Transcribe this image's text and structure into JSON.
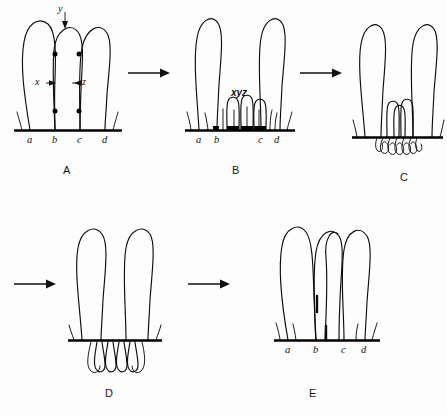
{
  "figure": {
    "background_color": "#fdfdfd",
    "ink_color": "#0d0d0d",
    "width": 447,
    "height": 415
  },
  "panels": [
    {
      "id": "A",
      "letter": "A",
      "letter_x": 63,
      "letter_y": 165,
      "origin_x": 8,
      "origin_y": 4,
      "baseline_label": [
        "a",
        "b",
        "c",
        "d"
      ],
      "tick_positions": [
        22,
        47,
        72,
        97
      ],
      "markers": [
        {
          "name": "y",
          "text": "y",
          "x": 45,
          "y": 2,
          "style": "marker-label"
        },
        {
          "name": "x",
          "text": "x",
          "x": 28,
          "y": 74,
          "style": "marker-label"
        },
        {
          "name": "z",
          "text": "z",
          "x": 62,
          "y": 74,
          "style": "marker-label"
        }
      ],
      "node_count": 4,
      "loop_count": 3
    },
    {
      "id": "B",
      "letter": "B",
      "letter_x": 232,
      "letter_y": 165,
      "origin_x": 183,
      "origin_y": 4,
      "baseline_label": [
        "a",
        "b",
        "c",
        "d"
      ],
      "tick_positions": [
        16,
        34,
        78,
        94
      ],
      "markers": [
        {
          "name": "xyz",
          "text": "xyz",
          "x": 39,
          "y": 87,
          "style": "marker-label bold-ital"
        }
      ],
      "small_loop_count": 3,
      "tall_loop_count": 2
    },
    {
      "id": "C",
      "letter": "C",
      "letter_x": 400,
      "letter_y": 172,
      "origin_x": 347,
      "origin_y": 12,
      "baseline_label": [],
      "tick_positions": [],
      "markers": [],
      "small_loop_count": 3,
      "tall_loop_count": 2,
      "tangle": true
    },
    {
      "id": "D",
      "letter": "D",
      "letter_x": 105,
      "letter_y": 388,
      "origin_x": 58,
      "origin_y": 222,
      "baseline_label": [],
      "tick_positions": [],
      "markers": [],
      "tall_loop_count": 2,
      "hanging_loop_count": 4
    },
    {
      "id": "E",
      "letter": "E",
      "letter_x": 309,
      "letter_y": 388,
      "origin_x": 268,
      "origin_y": 222,
      "baseline_label": [
        "a",
        "b",
        "c",
        "d"
      ],
      "tick_positions": [
        20,
        48,
        76,
        96
      ],
      "markers": [],
      "loop_count": 3,
      "crossed": true
    }
  ],
  "arrows": [
    {
      "name": "arrow-a-to-b",
      "x": 128,
      "y": 72,
      "length": 40
    },
    {
      "name": "arrow-b-to-c",
      "x": 300,
      "y": 72,
      "length": 40
    },
    {
      "name": "arrow-c-to-d",
      "x": 14,
      "y": 283,
      "length": 40
    },
    {
      "name": "arrow-d-to-e",
      "x": 188,
      "y": 283,
      "length": 40
    }
  ]
}
